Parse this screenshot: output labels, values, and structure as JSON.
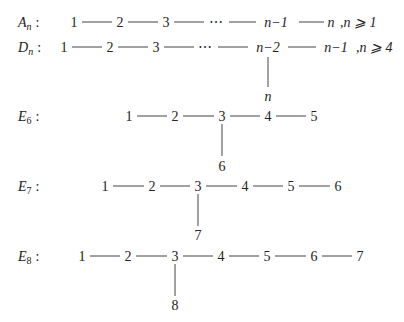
{
  "diagrams": [
    {
      "name": "A_n",
      "label": {
        "base": "A",
        "sub": "n",
        "colon": ":"
      },
      "nodes": [
        "1",
        "2",
        "3",
        "⋯",
        "n−1",
        "n"
      ],
      "condition": ",n ⩾ 1"
    },
    {
      "name": "D_n",
      "label": {
        "base": "D",
        "sub": "n",
        "colon": ":"
      },
      "nodes": [
        "1",
        "2",
        "3",
        "⋯",
        "n−2",
        "n−1"
      ],
      "branch": {
        "from": "n−2",
        "node": "n"
      },
      "condition": ",n ⩾ 4"
    },
    {
      "name": "E_6",
      "label": {
        "base": "E",
        "sub": "6",
        "colon": ":"
      },
      "nodes": [
        "1",
        "2",
        "3",
        "4",
        "5"
      ],
      "branch": {
        "from": "3",
        "node": "6"
      }
    },
    {
      "name": "E_7",
      "label": {
        "base": "E",
        "sub": "7",
        "colon": ":"
      },
      "nodes": [
        "1",
        "2",
        "3",
        "4",
        "5",
        "6"
      ],
      "branch": {
        "from": "3",
        "node": "7"
      }
    },
    {
      "name": "E_8",
      "label": {
        "base": "E",
        "sub": "8",
        "colon": ":"
      },
      "nodes": [
        "1",
        "2",
        "3",
        "4",
        "5",
        "6",
        "7"
      ],
      "branch": {
        "from": "3",
        "node": "8"
      }
    }
  ]
}
